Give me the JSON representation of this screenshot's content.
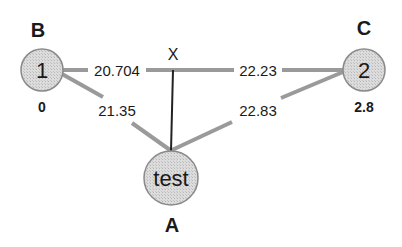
{
  "diagram": {
    "nodes": [
      {
        "id": "1",
        "text": "1",
        "letter": "B",
        "value": "0"
      },
      {
        "id": "2",
        "text": "2",
        "letter": "C",
        "value": "2.8"
      },
      {
        "id": "test",
        "text": "test",
        "letter": "A"
      }
    ],
    "junction": {
      "label": "X"
    },
    "edges": [
      {
        "from": "1",
        "to": "X",
        "label": "20.704"
      },
      {
        "from": "X",
        "to": "2",
        "label": "22.23"
      },
      {
        "from": "1",
        "to": "test",
        "label": "21.35"
      },
      {
        "from": "2",
        "to": "test",
        "label": "22.83"
      },
      {
        "from": "X",
        "to": "test",
        "label": ""
      }
    ]
  },
  "colors": {
    "node_fill": "#d9d9d9",
    "node_stroke": "#888888",
    "edge": "#999999",
    "solid_edge": "#222222",
    "text": "#1a1a1a"
  }
}
